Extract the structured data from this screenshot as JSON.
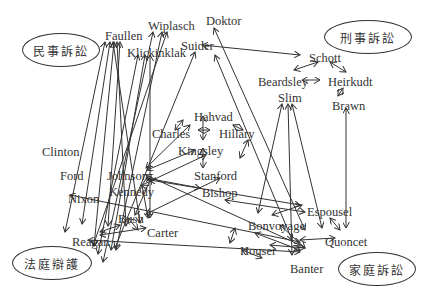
{
  "diagram": {
    "categories": [
      {
        "id": "civil",
        "label": "民事訴訟",
        "x": 22,
        "y": 33,
        "w": 78,
        "h": 34
      },
      {
        "id": "criminal",
        "label": "刑事訴訟",
        "x": 324,
        "y": 20,
        "w": 88,
        "h": 34
      },
      {
        "id": "defense",
        "label": "法庭辯護",
        "x": 12,
        "y": 246,
        "w": 80,
        "h": 34
      },
      {
        "id": "family",
        "label": "家庭訴訟",
        "x": 338,
        "y": 252,
        "w": 78,
        "h": 34
      }
    ],
    "nodes": [
      {
        "id": "faullen",
        "label": "Faullen",
        "x": 105,
        "y": 30
      },
      {
        "id": "wiplasch",
        "label": "Wiplasch",
        "x": 148,
        "y": 20
      },
      {
        "id": "doktor",
        "label": "Doktor",
        "x": 206,
        "y": 15
      },
      {
        "id": "klickinklak",
        "label": "Klickinklak",
        "x": 127,
        "y": 47
      },
      {
        "id": "suider",
        "label": "Suider",
        "x": 181,
        "y": 40
      },
      {
        "id": "schott",
        "label": "Schott",
        "x": 309,
        "y": 52
      },
      {
        "id": "beardsley",
        "label": "Beardsley",
        "x": 258,
        "y": 76
      },
      {
        "id": "heirkudt",
        "label": "Heirkudt",
        "x": 328,
        "y": 76
      },
      {
        "id": "slim",
        "label": "Slim",
        "x": 278,
        "y": 92
      },
      {
        "id": "brawn",
        "label": "Brawn",
        "x": 332,
        "y": 100
      },
      {
        "id": "hahvad",
        "label": "Hahvad",
        "x": 194,
        "y": 111
      },
      {
        "id": "charles",
        "label": "Charles",
        "x": 152,
        "y": 128
      },
      {
        "id": "hillary",
        "label": "Hillary",
        "x": 219,
        "y": 128
      },
      {
        "id": "kingsley",
        "label": "Kingsley",
        "x": 178,
        "y": 145
      },
      {
        "id": "clinton",
        "label": "Clinton",
        "x": 42,
        "y": 146
      },
      {
        "id": "ford",
        "label": "Ford",
        "x": 60,
        "y": 170
      },
      {
        "id": "johnson",
        "label": "Johnson",
        "x": 107,
        "y": 170
      },
      {
        "id": "stanford",
        "label": "Stanford",
        "x": 194,
        "y": 170
      },
      {
        "id": "kennedy",
        "label": "Kennedy",
        "x": 109,
        "y": 186
      },
      {
        "id": "bishop",
        "label": "Bishop",
        "x": 202,
        "y": 187
      },
      {
        "id": "nixon",
        "label": "Nixon",
        "x": 68,
        "y": 193
      },
      {
        "id": "bush",
        "label": "Bush",
        "x": 118,
        "y": 213
      },
      {
        "id": "carter",
        "label": "Carter",
        "x": 147,
        "y": 227
      },
      {
        "id": "reagan",
        "label": "Reagan",
        "x": 72,
        "y": 236
      },
      {
        "id": "espousel",
        "label": "Espousel",
        "x": 307,
        "y": 206
      },
      {
        "id": "bonvoyage",
        "label": "Bonvoyage",
        "x": 248,
        "y": 220
      },
      {
        "id": "quoncet",
        "label": "Quoncet",
        "x": 325,
        "y": 236
      },
      {
        "id": "houser",
        "label": "Houser",
        "x": 240,
        "y": 245
      },
      {
        "id": "banter",
        "label": "Banter",
        "x": 290,
        "y": 263
      }
    ],
    "edges": [
      [
        105,
        42,
        65,
        232
      ],
      [
        110,
        42,
        82,
        224
      ],
      [
        114,
        42,
        94,
        246
      ],
      [
        117,
        42,
        126,
        226
      ],
      [
        120,
        42,
        108,
        226
      ],
      [
        113,
        42,
        140,
        223
      ],
      [
        153,
        32,
        103,
        262
      ],
      [
        162,
        32,
        116,
        250
      ],
      [
        167,
        32,
        93,
        246
      ],
      [
        138,
        55,
        98,
        254
      ],
      [
        145,
        55,
        111,
        250
      ],
      [
        150,
        55,
        150,
        218
      ],
      [
        195,
        52,
        115,
        248
      ],
      [
        214,
        28,
        305,
        230
      ],
      [
        215,
        55,
        292,
        240
      ],
      [
        202,
        45,
        300,
        55
      ],
      [
        318,
        62,
        294,
        70
      ],
      [
        330,
        62,
        346,
        72
      ],
      [
        302,
        80,
        320,
        80
      ],
      [
        338,
        96,
        343,
        88
      ],
      [
        282,
        104,
        258,
        213
      ],
      [
        288,
        104,
        292,
        255
      ],
      [
        292,
        104,
        322,
        228
      ],
      [
        346,
        108,
        346,
        228
      ],
      [
        183,
        120,
        175,
        130
      ],
      [
        198,
        130,
        210,
        130
      ],
      [
        203,
        116,
        203,
        140
      ],
      [
        233,
        125,
        243,
        130
      ],
      [
        248,
        140,
        240,
        158
      ],
      [
        203,
        148,
        203,
        168
      ],
      [
        190,
        125,
        146,
        168
      ],
      [
        195,
        150,
        147,
        170
      ],
      [
        206,
        155,
        142,
        185
      ],
      [
        146,
        178,
        200,
        188
      ],
      [
        150,
        180,
        300,
        205
      ],
      [
        146,
        175,
        300,
        245
      ],
      [
        142,
        185,
        148,
        218
      ],
      [
        151,
        178,
        135,
        215
      ],
      [
        220,
        178,
        146,
        214
      ],
      [
        70,
        195,
        300,
        242
      ],
      [
        100,
        232,
        120,
        225
      ],
      [
        100,
        235,
        146,
        228
      ],
      [
        128,
        218,
        138,
        230
      ],
      [
        88,
        240,
        300,
        252
      ],
      [
        225,
        200,
        305,
        212
      ],
      [
        272,
        215,
        302,
        205
      ],
      [
        280,
        225,
        305,
        248
      ],
      [
        270,
        245,
        305,
        248
      ],
      [
        235,
        228,
        230,
        243
      ],
      [
        242,
        250,
        262,
        258
      ],
      [
        330,
        218,
        340,
        230
      ],
      [
        300,
        240,
        335,
        238
      ],
      [
        255,
        233,
        300,
        250
      ]
    ]
  }
}
